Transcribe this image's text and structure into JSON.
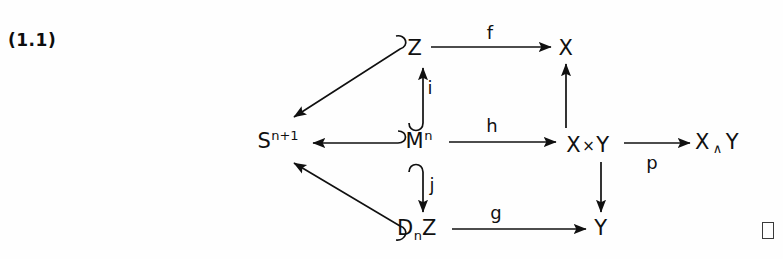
{
  "figure": {
    "equation_number": "(1.1)",
    "type": "commutative-diagram",
    "width": 783,
    "height": 259,
    "background_color": "#fefefe",
    "ink_color": "#101010"
  },
  "nodes": [
    {
      "id": "Z",
      "label": "Z",
      "base": "Z",
      "sup": "",
      "sub": "",
      "x": 415,
      "y": 48
    },
    {
      "id": "X",
      "label": "X",
      "base": "X",
      "sup": "",
      "sub": "",
      "x": 566,
      "y": 48
    },
    {
      "id": "Snplus1",
      "label": "S^{n+1}",
      "base": "S",
      "sup": "n+1",
      "sub": "",
      "x": 278,
      "y": 141
    },
    {
      "id": "Mn",
      "label": "M^n",
      "base": "M",
      "sup": "n",
      "sub": "",
      "x": 419,
      "y": 141
    },
    {
      "id": "XtimesY",
      "label": "X × Y",
      "base": "X",
      "sup": "",
      "sub": "",
      "x": 588,
      "y": 145
    },
    {
      "id": "XwedgeY",
      "label": "X ∧ Y",
      "base": "X",
      "sup": "",
      "sub": "",
      "x": 717,
      "y": 143
    },
    {
      "id": "DnZ",
      "label": "D_n Z",
      "base": "D",
      "sup": "",
      "sub": "n",
      "x": 417,
      "y": 228
    },
    {
      "id": "Y",
      "label": "Y",
      "base": "Y",
      "sup": "",
      "sub": "",
      "x": 601,
      "y": 228
    }
  ],
  "node_text": {
    "Z": "Z",
    "X": "X",
    "S_base": "S",
    "S_sup": "n+1",
    "M_base": "M",
    "M_sup": "n",
    "XtimesY_left": "X",
    "XtimesY_op": "×",
    "XtimesY_right": "Y",
    "XwedgeY_left": "X",
    "XwedgeY_op": "∧",
    "XwedgeY_right": "Y",
    "D_base": "D",
    "D_sub": "n",
    "D_tail": "Z",
    "Y": "Y"
  },
  "arrows": [
    {
      "id": "f",
      "from": "Z",
      "to": "X",
      "label": "f",
      "label_x": 490,
      "label_y": 33,
      "label_side": "above",
      "style": "straight",
      "hooked": false
    },
    {
      "id": "i",
      "from": "Mn",
      "to": "Z",
      "label": "i",
      "label_x": 430,
      "label_y": 88,
      "label_side": "right",
      "style": "vertical-up",
      "hooked": true
    },
    {
      "id": "j",
      "from": "Mn",
      "to": "DnZ",
      "label": "j",
      "label_x": 432,
      "label_y": 185,
      "label_side": "right",
      "style": "vertical-down",
      "hooked": true
    },
    {
      "id": "h",
      "from": "Mn",
      "to": "XtimesY",
      "label": "h",
      "label_x": 492,
      "label_y": 126,
      "label_side": "above",
      "style": "straight",
      "hooked": false
    },
    {
      "id": "g",
      "from": "DnZ",
      "to": "Y",
      "label": "g",
      "label_x": 496,
      "label_y": 213,
      "label_side": "above",
      "style": "straight",
      "hooked": false
    },
    {
      "id": "p",
      "from": "XtimesY",
      "to": "XwedgeY",
      "label": "p",
      "label_x": 652,
      "label_y": 163,
      "label_side": "below",
      "style": "straight",
      "hooked": false
    },
    {
      "id": "proj-x",
      "from": "XtimesY",
      "to": "X",
      "label": "",
      "label_x": 0,
      "label_y": 0,
      "label_side": "none",
      "style": "vertical-up",
      "hooked": false
    },
    {
      "id": "proj-y",
      "from": "XtimesY",
      "to": "Y",
      "label": "",
      "label_x": 0,
      "label_y": 0,
      "label_side": "none",
      "style": "vertical-down",
      "hooked": false
    },
    {
      "id": "m-to-s",
      "from": "Mn",
      "to": "Snplus1",
      "label": "",
      "label_x": 0,
      "label_y": 0,
      "label_side": "none",
      "style": "horizontal-left",
      "hooked": true
    },
    {
      "id": "z-to-s",
      "from": "Z",
      "to": "Snplus1",
      "label": "",
      "label_x": 0,
      "label_y": 0,
      "label_side": "none",
      "style": "diagonal",
      "hooked": true
    },
    {
      "id": "d-to-s",
      "from": "DnZ",
      "to": "Snplus1",
      "label": "",
      "label_x": 0,
      "label_y": 0,
      "label_side": "none",
      "style": "diagonal",
      "hooked": true
    }
  ],
  "annotations": {
    "qed_symbol": "□",
    "qed_present": true
  }
}
